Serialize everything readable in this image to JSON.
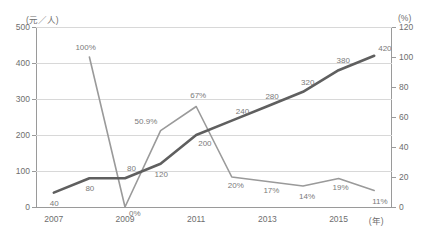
{
  "meta": {
    "clipped_header_text": "",
    "clipped_footer_text": ""
  },
  "axes": {
    "left_unit": "(元／人)",
    "right_unit": "(%)",
    "x_unit": "(年)",
    "left_ticks": [
      "0",
      "100",
      "200",
      "300",
      "400",
      "500"
    ],
    "right_ticks": [
      "0",
      "20",
      "40",
      "60",
      "80",
      "100",
      "120"
    ],
    "x_ticks": [
      "2007",
      "2009",
      "2011",
      "2013",
      "2015"
    ]
  },
  "chart_data": {
    "type": "line",
    "title": "",
    "xlabel": "(年)",
    "ylabel": "(元／人)",
    "y2label": "(%)",
    "grid": true,
    "legend": "none",
    "x": [
      2007,
      2008,
      2009,
      2010,
      2011,
      2012,
      2013,
      2014,
      2015,
      2016
    ],
    "categories": [
      "2007",
      "2008",
      "2009",
      "2010",
      "2011",
      "2012",
      "2013",
      "2014",
      "2015",
      "2016"
    ],
    "ylim": [
      0,
      500
    ],
    "y2lim": [
      0,
      120
    ],
    "series": [
      {
        "name": "人均金额",
        "axis": "left",
        "unit": "元／人",
        "color": "#5f5f5f",
        "width": 2.6,
        "values": [
          40,
          80,
          80,
          120,
          200,
          240,
          280,
          320,
          380,
          420
        ],
        "labels": [
          "40",
          "80",
          "80",
          "120",
          "200",
          "240",
          "280",
          "320",
          "380",
          "420"
        ]
      },
      {
        "name": "增长率",
        "axis": "right",
        "unit": "%",
        "color": "#9a9a9a",
        "width": 1.6,
        "values": [
          null,
          100,
          0,
          50.9,
          67,
          20,
          17,
          14,
          19,
          11
        ],
        "labels": [
          null,
          "100%",
          "0%",
          "50.9%",
          "67%",
          "20%",
          "17%",
          "14%",
          "19%",
          "11%"
        ]
      }
    ]
  }
}
